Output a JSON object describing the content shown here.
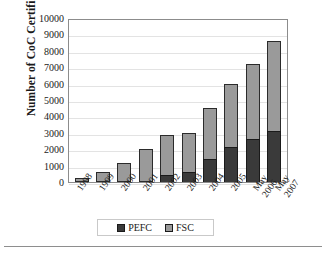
{
  "chart_data": {
    "type": "bar",
    "stacked": true,
    "title": "",
    "xlabel": "",
    "ylabel": "Number of CoC Certificates",
    "ylim": [
      0,
      10000
    ],
    "ytick_step": 1000,
    "yticks": [
      "10000",
      "9000",
      "8000",
      "7000",
      "6000",
      "5000",
      "4000",
      "3000",
      "2000",
      "1000",
      "0"
    ],
    "grid": true,
    "legend_position": "bottom",
    "categories": [
      "1998",
      "1999",
      "2000",
      "2001",
      "2002",
      "2003",
      "2004",
      "2005",
      "May 2006",
      "May 2007"
    ],
    "series": [
      {
        "name": "PEFC",
        "color": "#3a3a3a",
        "values": [
          0,
          0,
          0,
          0,
          430,
          600,
          1400,
          2150,
          2620,
          3100
        ]
      },
      {
        "name": "FSC",
        "color": "#9a9a9a",
        "values": [
          250,
          600,
          1150,
          2030,
          2420,
          2380,
          3100,
          3850,
          4580,
          5500
        ]
      }
    ],
    "totals": [
      250,
      600,
      1150,
      2030,
      2850,
      2980,
      4500,
      6000,
      7200,
      8600
    ]
  },
  "legend": {
    "items": [
      {
        "label": "PEFC",
        "swatch": "pefc-swatch"
      },
      {
        "label": "FSC",
        "swatch": "fsc-swatch"
      }
    ]
  },
  "colors": {
    "pefc": "#3a3a3a",
    "fsc": "#9a9a9a",
    "frame": "#8c8c8c",
    "grid": "#e3e3e3",
    "text": "#1a1a1a"
  }
}
